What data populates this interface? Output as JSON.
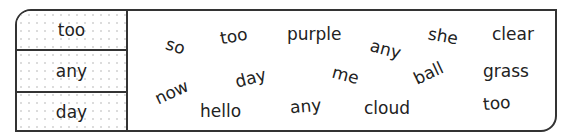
{
  "worksheet": {
    "target_words": [
      "too",
      "any",
      "day"
    ],
    "word_cloud": [
      {
        "text": "so",
        "x": 166,
        "y": 36,
        "rot": 18
      },
      {
        "text": "too",
        "x": 220,
        "y": 26,
        "rot": -10
      },
      {
        "text": "purple",
        "x": 287,
        "y": 24,
        "rot": 0
      },
      {
        "text": "any",
        "x": 370,
        "y": 39,
        "rot": 15
      },
      {
        "text": "she",
        "x": 428,
        "y": 26,
        "rot": 10
      },
      {
        "text": "clear",
        "x": 492,
        "y": 24,
        "rot": 0
      },
      {
        "text": "now",
        "x": 154,
        "y": 82,
        "rot": -25
      },
      {
        "text": "day",
        "x": 235,
        "y": 68,
        "rot": -15
      },
      {
        "text": "me",
        "x": 332,
        "y": 65,
        "rot": 15
      },
      {
        "text": "ball",
        "x": 413,
        "y": 63,
        "rot": -25
      },
      {
        "text": "grass",
        "x": 483,
        "y": 61,
        "rot": 0
      },
      {
        "text": "hello",
        "x": 200,
        "y": 101,
        "rot": 0
      },
      {
        "text": "any",
        "x": 290,
        "y": 96,
        "rot": -5
      },
      {
        "text": "cloud",
        "x": 364,
        "y": 98,
        "rot": 0
      },
      {
        "text": "too",
        "x": 483,
        "y": 93,
        "rot": -5
      }
    ]
  }
}
